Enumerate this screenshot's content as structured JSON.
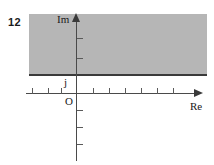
{
  "figure": {
    "problem_number": "12",
    "width": 214,
    "height": 165
  },
  "chart_data": {
    "type": "area",
    "title": "",
    "subtitle": "",
    "xlabel": "Re",
    "ylabel": "Im",
    "origin_label": "O",
    "grid": false,
    "legend": null,
    "axes": {
      "x": {
        "label": "Re",
        "label_x_px": 190,
        "axis_y_px": 93,
        "start_px": 26,
        "end_px": 196,
        "arrow": "right",
        "tick_labels": [],
        "tick_positions_px": [
          32,
          48,
          61,
          93,
          109,
          125,
          141,
          157,
          173
        ]
      },
      "y": {
        "label": "Im",
        "label_y_px": 13,
        "axis_x_px": 76,
        "start_px": 13,
        "end_px": 161,
        "arrow": "up",
        "tick_labels": [],
        "tick_positions_px": [
          38,
          58,
          110,
          127,
          144
        ]
      }
    },
    "regions": [
      {
        "name": "shaded-half-plane",
        "description": "Shaded region above and including the horizontal line Im = j",
        "fill_color": "#b6b6b6",
        "boundary_color": "#3a3a3a",
        "boundary_style": "solid",
        "boundary_included": true,
        "boundary_label": "j",
        "boundary_y_px": 75,
        "extent_px": {
          "left": 29,
          "top": 14,
          "right": 207,
          "bottom": 76
        }
      }
    ],
    "annotations": [
      {
        "text": "j",
        "x_px": 64,
        "y_px": 76,
        "name": "boundary-value-label"
      },
      {
        "text": "O",
        "x_px": 65,
        "y_px": 95,
        "name": "origin-label"
      },
      {
        "text": "Im",
        "x_px": 57,
        "y_px": 13,
        "name": "imaginary-axis-label"
      },
      {
        "text": "Re",
        "x_px": 190,
        "y_px": 100,
        "name": "real-axis-label"
      },
      {
        "text": "12",
        "x_px": 8,
        "y_px": 16,
        "name": "problem-number-label"
      }
    ],
    "colors": {
      "shade": "#b6b6b6",
      "axis": "#4a4a4a",
      "boundary": "#3a3a3a",
      "text": "#1a1a1a",
      "background": "#ffffff"
    }
  }
}
